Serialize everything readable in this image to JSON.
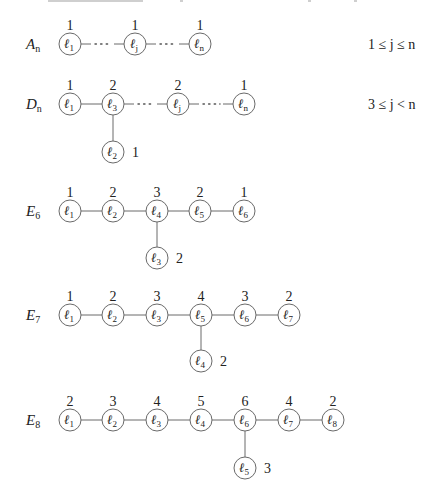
{
  "figure": {
    "node_radius": 11,
    "rows": [
      {
        "id": "A",
        "name": "A",
        "name_sub": "n",
        "name_pos": [
          26,
          49
        ],
        "constraint": "1 ≤ j ≤ n",
        "constraint_pos": [
          368,
          49
        ],
        "nodes": [
          {
            "label": "ℓ",
            "sub": "1",
            "coef": "1",
            "x": 70,
            "y": 44
          },
          {
            "label": "ℓ",
            "sub": "j",
            "coef": "1",
            "x": 135,
            "y": 44
          },
          {
            "label": "ℓ",
            "sub": "n",
            "coef": "1",
            "x": 200,
            "y": 44
          }
        ],
        "edges": [
          {
            "from": 0,
            "to": 1,
            "style": "dotted"
          },
          {
            "from": 1,
            "to": 2,
            "style": "dotted"
          }
        ],
        "branch": null
      },
      {
        "id": "D",
        "name": "D",
        "name_sub": "n",
        "name_pos": [
          26,
          109
        ],
        "constraint": "3 ≤ j < n",
        "constraint_pos": [
          368,
          109
        ],
        "nodes": [
          {
            "label": "ℓ",
            "sub": "1",
            "coef": "1",
            "x": 70,
            "y": 104
          },
          {
            "label": "ℓ",
            "sub": "3",
            "coef": "2",
            "x": 113,
            "y": 104
          },
          {
            "label": "ℓ",
            "sub": "j",
            "coef": "2",
            "x": 178,
            "y": 104
          },
          {
            "label": "ℓ",
            "sub": "n",
            "coef": "1",
            "x": 244,
            "y": 104
          }
        ],
        "edges": [
          {
            "from": 0,
            "to": 1,
            "style": "solid"
          },
          {
            "from": 1,
            "to": 2,
            "style": "dotted"
          },
          {
            "from": 2,
            "to": 3,
            "style": "dotted"
          }
        ],
        "branch": {
          "attach": 1,
          "label": "ℓ",
          "sub": "2",
          "coef": "1",
          "x": 113,
          "y": 152
        }
      },
      {
        "id": "E6",
        "name": "E",
        "name_sub": "6",
        "name_pos": [
          26,
          216
        ],
        "constraint": "",
        "constraint_pos": [
          368,
          216
        ],
        "nodes": [
          {
            "label": "ℓ",
            "sub": "1",
            "coef": "1",
            "x": 70,
            "y": 211
          },
          {
            "label": "ℓ",
            "sub": "2",
            "coef": "2",
            "x": 113,
            "y": 211
          },
          {
            "label": "ℓ",
            "sub": "4",
            "coef": "3",
            "x": 157,
            "y": 211
          },
          {
            "label": "ℓ",
            "sub": "5",
            "coef": "2",
            "x": 200,
            "y": 211
          },
          {
            "label": "ℓ",
            "sub": "6",
            "coef": "1",
            "x": 244,
            "y": 211
          }
        ],
        "edges": [
          {
            "from": 0,
            "to": 1,
            "style": "solid"
          },
          {
            "from": 1,
            "to": 2,
            "style": "solid"
          },
          {
            "from": 2,
            "to": 3,
            "style": "solid"
          },
          {
            "from": 3,
            "to": 4,
            "style": "solid"
          }
        ],
        "branch": {
          "attach": 2,
          "label": "ℓ",
          "sub": "3",
          "coef": "2",
          "x": 157,
          "y": 258
        }
      },
      {
        "id": "E7",
        "name": "E",
        "name_sub": "7",
        "name_pos": [
          26,
          320
        ],
        "constraint": "",
        "constraint_pos": [
          368,
          320
        ],
        "nodes": [
          {
            "label": "ℓ",
            "sub": "1",
            "coef": "1",
            "x": 70,
            "y": 315
          },
          {
            "label": "ℓ",
            "sub": "2",
            "coef": "2",
            "x": 113,
            "y": 315
          },
          {
            "label": "ℓ",
            "sub": "3",
            "coef": "3",
            "x": 157,
            "y": 315
          },
          {
            "label": "ℓ",
            "sub": "5",
            "coef": "4",
            "x": 201,
            "y": 315
          },
          {
            "label": "ℓ",
            "sub": "6",
            "coef": "3",
            "x": 245,
            "y": 315
          },
          {
            "label": "ℓ",
            "sub": "7",
            "coef": "2",
            "x": 289,
            "y": 315
          }
        ],
        "edges": [
          {
            "from": 0,
            "to": 1,
            "style": "solid"
          },
          {
            "from": 1,
            "to": 2,
            "style": "solid"
          },
          {
            "from": 2,
            "to": 3,
            "style": "solid"
          },
          {
            "from": 3,
            "to": 4,
            "style": "solid"
          },
          {
            "from": 4,
            "to": 5,
            "style": "solid"
          }
        ],
        "branch": {
          "attach": 3,
          "label": "ℓ",
          "sub": "4",
          "coef": "2",
          "x": 201,
          "y": 361
        }
      },
      {
        "id": "E8",
        "name": "E",
        "name_sub": "8",
        "name_pos": [
          26,
          425
        ],
        "constraint": "",
        "constraint_pos": [
          368,
          425
        ],
        "nodes": [
          {
            "label": "ℓ",
            "sub": "1",
            "coef": "2",
            "x": 70,
            "y": 420
          },
          {
            "label": "ℓ",
            "sub": "2",
            "coef": "3",
            "x": 113,
            "y": 420
          },
          {
            "label": "ℓ",
            "sub": "3",
            "coef": "4",
            "x": 157,
            "y": 420
          },
          {
            "label": "ℓ",
            "sub": "4",
            "coef": "5",
            "x": 201,
            "y": 420
          },
          {
            "label": "ℓ",
            "sub": "6",
            "coef": "6",
            "x": 245,
            "y": 420
          },
          {
            "label": "ℓ",
            "sub": "7",
            "coef": "4",
            "x": 289,
            "y": 420
          },
          {
            "label": "ℓ",
            "sub": "8",
            "coef": "2",
            "x": 333,
            "y": 420
          }
        ],
        "edges": [
          {
            "from": 0,
            "to": 1,
            "style": "solid"
          },
          {
            "from": 1,
            "to": 2,
            "style": "solid"
          },
          {
            "from": 2,
            "to": 3,
            "style": "solid"
          },
          {
            "from": 3,
            "to": 4,
            "style": "solid"
          },
          {
            "from": 4,
            "to": 5,
            "style": "solid"
          },
          {
            "from": 5,
            "to": 6,
            "style": "solid"
          }
        ],
        "branch": {
          "attach": 4,
          "label": "ℓ",
          "sub": "5",
          "coef": "3",
          "x": 245,
          "y": 468
        }
      }
    ]
  }
}
